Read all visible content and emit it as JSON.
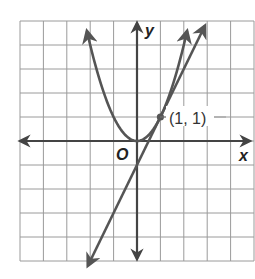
{
  "chart_data": {
    "type": "line",
    "title": "",
    "xlabel": "x",
    "ylabel": "y",
    "origin_label": "O",
    "xlim": [
      -5,
      5
    ],
    "ylim": [
      -5,
      5
    ],
    "grid": true,
    "grid_step": 1,
    "series": [
      {
        "name": "parabola",
        "equation": "y = x^2",
        "x_range": [
          -2.14,
          2.14
        ],
        "arrows": "both-ends",
        "color": "#555555"
      },
      {
        "name": "tangent-line",
        "equation": "y = 2x - 1",
        "x_range": [
          -2.1,
          2.9
        ],
        "arrows": "both-ends",
        "color": "#555555"
      }
    ],
    "points": [
      {
        "x": 1,
        "y": 1,
        "label": "(1, 1)"
      }
    ],
    "annotations": [
      "(1, 1)"
    ]
  },
  "labels": {
    "x_axis": "x",
    "y_axis": "y",
    "origin": "O",
    "point": "(1, 1)"
  },
  "colors": {
    "grid": "#9a9a9a",
    "axes": "#444444",
    "curves": "#555555",
    "background": "#ffffff"
  }
}
